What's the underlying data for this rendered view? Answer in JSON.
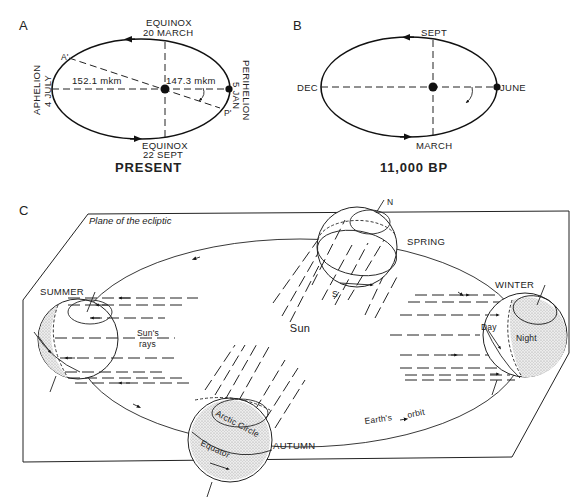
{
  "panels": {
    "a": {
      "letter": "A",
      "caption": "PRESENT",
      "top_label_1": "EQUINOX",
      "top_label_2": "20 MARCH",
      "bottom_label_1": "EQUINOX",
      "bottom_label_2": "22 SEPT",
      "left_label_1": "APHELION",
      "left_label_2": "4 JULY",
      "right_label_1": "PERIHELION",
      "right_label_2": "5 JAN",
      "aphelion_distance": "152.1 mkm",
      "perihelion_distance": "147.3 mkm",
      "point_a": "A'",
      "point_p": "P'"
    },
    "b": {
      "letter": "B",
      "caption": "11,000 BP",
      "top_label": "SEPT",
      "bottom_label": "MARCH",
      "left_label": "DEC",
      "right_label": "JUNE"
    },
    "c": {
      "letter": "C",
      "plane_label": "Plane of the ecliptic",
      "sun_label": "Sun",
      "rays_label_1": "Sun's",
      "rays_label_2": "rays",
      "orbit_label_1": "Earth's",
      "orbit_label_2": "orbit",
      "seasons": {
        "spring": "SPRING",
        "summer": "SUMMER",
        "autumn": "AUTUMN",
        "winter": "WINTER"
      },
      "pole_n": "N",
      "pole_s": "S",
      "day_label": "Day",
      "night_label": "Night",
      "arctic_circle_label": "Arctic Circle",
      "equator_label": "Equator"
    }
  }
}
